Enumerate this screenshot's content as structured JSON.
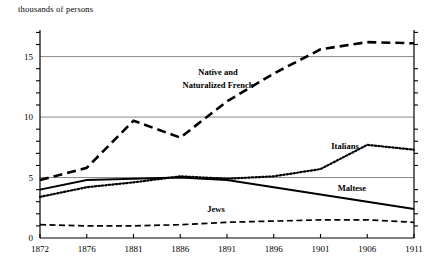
{
  "chart_data": {
    "type": "line",
    "title": "",
    "ylabel": "thousands of persons",
    "xlabel": "",
    "ylim": [
      0,
      17.2
    ],
    "xlim": [
      1872,
      1911
    ],
    "grid": "horizontal gridlines at 5, 10, 15",
    "legend_position": "inline labels on plot",
    "y_ticks_major": [
      0,
      5,
      10,
      15
    ],
    "y_ticks_minor": [
      1,
      2,
      3,
      4,
      6,
      7,
      8,
      9,
      11,
      12,
      13,
      14,
      16,
      17
    ],
    "x_tick_labels": [
      "1872",
      "1876",
      "1881",
      "1886",
      "1891",
      "1896",
      "1901",
      "1906",
      "1911"
    ],
    "x": [
      1872,
      1876,
      1881,
      1886,
      1891,
      1896,
      1901,
      1906,
      1911
    ],
    "series": [
      {
        "name": "Native and Naturalized French",
        "style": "thick-dashed",
        "values": [
          4.8,
          5.8,
          9.7,
          8.3,
          11.3,
          13.6,
          15.6,
          16.2,
          16.1
        ]
      },
      {
        "name": "Italians",
        "style": "dotted",
        "values": [
          3.4,
          4.2,
          4.6,
          5.1,
          4.9,
          5.1,
          5.7,
          7.7,
          7.3
        ]
      },
      {
        "name": "Maltese",
        "style": "solid",
        "values": [
          4.0,
          4.8,
          4.9,
          5.0,
          4.8,
          4.2,
          3.6,
          3.0,
          2.4
        ]
      },
      {
        "name": "Jews",
        "style": "thin-dashed",
        "values": [
          1.1,
          1.0,
          1.0,
          1.1,
          1.3,
          1.4,
          1.5,
          1.5,
          1.3
        ]
      }
    ],
    "annotations": [
      {
        "text": "Native and",
        "x_px": 218,
        "y_px": 72
      },
      {
        "text": "Naturalized French",
        "x_px": 224,
        "y_px": 85
      },
      {
        "text": "Italians",
        "x_px": 345,
        "y_px": 146
      },
      {
        "text": "Maltese",
        "x_px": 350,
        "y_px": 188
      },
      {
        "text": "Jews",
        "x_px": 215,
        "y_px": 209
      }
    ]
  },
  "labels": {
    "axis_title": "thousands of persons",
    "french_line1": "Native and",
    "french_line2": "Naturalized French",
    "italians": "Italians",
    "maltese": "Maltese",
    "jews": "Jews",
    "y0": "0",
    "y5": "5",
    "y10": "10",
    "y15": "15",
    "x1872": "1872",
    "x1876": "1876",
    "x1881": "1881",
    "x1886": "1886",
    "x1891": "1891",
    "x1896": "1896",
    "x1901": "1901",
    "x1906": "1906",
    "x1911": "1911"
  },
  "colors": {
    "line": "#000000",
    "gridline": "#808080",
    "axis": "#000000",
    "background": "#ffffff"
  }
}
